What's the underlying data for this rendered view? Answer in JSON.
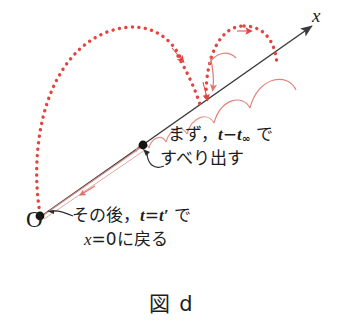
{
  "figure": {
    "caption": "図 d",
    "origin_label": "O",
    "axis_label": "x",
    "annotations": {
      "first_phase": {
        "line1_prefix": "まず，",
        "line1_var_t": "t",
        "line1_minus": "−",
        "line1_var_t_inf": "t",
        "line1_sub_inf": "∞",
        "line1_suffix": " で",
        "line2": "すべり出す"
      },
      "second_phase": {
        "line1_prefix": "その後，",
        "line1_var_t": "t",
        "line1_equals": "=",
        "line1_var_tprime": "t′",
        "line1_suffix": " で",
        "line2_var_x": "x",
        "line2_rest": "=0に戻る"
      }
    },
    "colors": {
      "axis": "#3b3b3b",
      "dotted_trajectory": "#e2453f",
      "solid_trajectory": "#e08a85",
      "return_line": "#d98a84",
      "marker": "#141414",
      "text": "#1d1d1d",
      "background": "#ffffff"
    },
    "elements": {
      "origin_point": "filled black dot at x=0",
      "slip_point": "filled black dot on axis partway along",
      "axis_arrow": "arrow pointing up-right labelled x",
      "big_dotted_arc": "large dotted red arc from origin to slip point",
      "second_dotted_arc": "dotted red arc hopping beyond slip point",
      "hop_arcs": "series of small solid red hop arcs growing along axis",
      "return_line": "thin red line returning from axis to origin"
    }
  }
}
